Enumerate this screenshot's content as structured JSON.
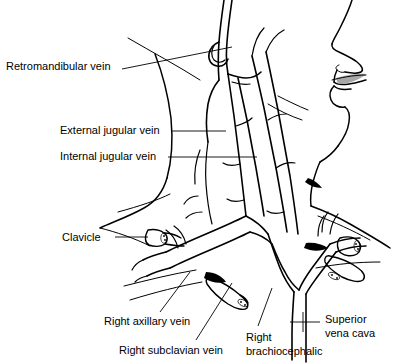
{
  "figure": {
    "view": "right lateral profile",
    "background_color": "#ffffff",
    "line_color": "#000000",
    "width": 395,
    "height": 364
  },
  "labels": [
    {
      "id": "retromandibular-vein",
      "text": "Retromandibular vein",
      "x": 6,
      "y": 60,
      "leader": "M 122,69 L 232,47"
    },
    {
      "id": "external-jugular-vein",
      "text": "External jugular vein",
      "x": 60,
      "y": 124,
      "leader": "M 172,131 L 226,131"
    },
    {
      "id": "internal-jugular-vein",
      "text": "Internal jugular vein",
      "x": 60,
      "y": 150,
      "leader": "M 168,157 L 257,157"
    },
    {
      "id": "clavicle",
      "text": "Clavicle",
      "x": 62,
      "y": 231,
      "leader": "M 115,237 L 148,237"
    },
    {
      "id": "right-axillary-vein",
      "text": "Right axillary vein",
      "x": 104,
      "y": 315,
      "leader": "M 160,312 L 190,272"
    },
    {
      "id": "right-subclavian-vein",
      "text": "Right subclavian vein",
      "x": 119,
      "y": 344,
      "leader": "M 196,340 L 232,283"
    },
    {
      "id": "right-brachiocephalic",
      "text": "Right\nbrachiocephalic",
      "line1": "Right",
      "line2": "brachiocephalic",
      "x": 246,
      "y": 331,
      "leader": "M 256,326 L 270,288"
    },
    {
      "id": "superior-vena-cava",
      "text": "Superior\nvena cava",
      "line1": "Superior",
      "line2": "vena cava",
      "x": 325,
      "y": 313,
      "leader": "M 290,322 L 320,322"
    }
  ],
  "structures": [
    "facial-profile",
    "nose",
    "lips",
    "chin",
    "mandible",
    "neck-contour",
    "sternocleidomastoid",
    "retromandibular-vein",
    "external-jugular-vein",
    "internal-jugular-vein",
    "anterior-jugular-vein",
    "facial-vein",
    "right-subclavian-vein",
    "right-axillary-vein",
    "right-brachiocephalic-vein",
    "left-brachiocephalic-vein",
    "superior-vena-cava",
    "right-clavicle-cut",
    "left-clavicle-cut",
    "first-rib-cut"
  ]
}
